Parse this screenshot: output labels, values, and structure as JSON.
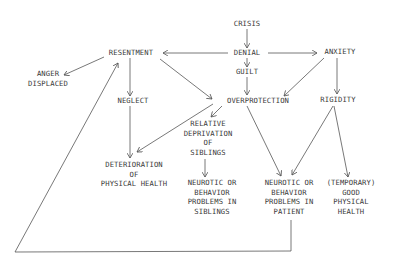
{
  "diagram": {
    "type": "flowchart",
    "nodes": {
      "crisis": {
        "lines": [
          "CRISIS"
        ]
      },
      "denial": {
        "lines": [
          "DENIAL"
        ]
      },
      "guilt": {
        "lines": [
          "GUILT"
        ]
      },
      "anxiety": {
        "lines": [
          "ANXIETY"
        ]
      },
      "resentment": {
        "lines": [
          "RESENTMENT"
        ]
      },
      "anger_displaced": {
        "lines": [
          "ANGER",
          "DISPLACED"
        ]
      },
      "neglect": {
        "lines": [
          "NEGLECT"
        ]
      },
      "overprotection": {
        "lines": [
          "OVERPROTECTION"
        ]
      },
      "rigidity": {
        "lines": [
          "RIGIDITY"
        ]
      },
      "relative_deprivation": {
        "lines": [
          "RELATIVE",
          "DEPRIVATION",
          "OF",
          "SIBLINGS"
        ]
      },
      "deterioration": {
        "lines": [
          "DETERIORATION",
          "OF",
          "PHYSICAL HEALTH"
        ]
      },
      "neurotic_siblings": {
        "lines": [
          "NEUROTIC OR",
          "BEHAVIOR",
          "PROBLEMS IN",
          "SIBLINGS"
        ]
      },
      "neurotic_patient": {
        "lines": [
          "NEUROTIC OR",
          "BEHAVIOR",
          "PROBLEMS IN",
          "PATIENT"
        ]
      },
      "good_health": {
        "lines": [
          "(TEMPORARY)",
          "GOOD",
          "PHYSICAL",
          "HEALTH"
        ]
      }
    },
    "edges": [
      {
        "from": "crisis",
        "to": "denial"
      },
      {
        "from": "denial",
        "to": "guilt"
      },
      {
        "from": "denial",
        "to": "resentment"
      },
      {
        "from": "denial",
        "to": "anxiety"
      },
      {
        "from": "resentment",
        "to": "anger_displaced"
      },
      {
        "from": "resentment",
        "to": "neglect"
      },
      {
        "from": "resentment",
        "to": "overprotection"
      },
      {
        "from": "guilt",
        "to": "overprotection"
      },
      {
        "from": "anxiety",
        "to": "overprotection"
      },
      {
        "from": "anxiety",
        "to": "rigidity"
      },
      {
        "from": "neglect",
        "to": "deterioration"
      },
      {
        "from": "overprotection",
        "to": "deterioration"
      },
      {
        "from": "overprotection",
        "to": "relative_deprivation"
      },
      {
        "from": "overprotection",
        "to": "neurotic_patient"
      },
      {
        "from": "relative_deprivation",
        "to": "neurotic_siblings"
      },
      {
        "from": "rigidity",
        "to": "neurotic_patient"
      },
      {
        "from": "rigidity",
        "to": "good_health"
      },
      {
        "from": "neurotic_patient",
        "to": "resentment",
        "note": "feedback loop"
      }
    ]
  }
}
